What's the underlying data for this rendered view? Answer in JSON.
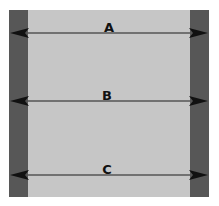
{
  "diagram": {
    "arrows": [
      {
        "label": "A"
      },
      {
        "label": "B"
      },
      {
        "label": "C"
      }
    ],
    "colors": {
      "background": "#c6c6c6",
      "walls": "#575757",
      "arrow": "#111111",
      "line": "#555555"
    }
  }
}
